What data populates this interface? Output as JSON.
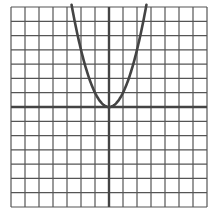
{
  "chart_data": {
    "type": "line",
    "title": "",
    "xlabel": "",
    "ylabel": "",
    "function": "y = x^2",
    "xlim": [
      -7,
      7
    ],
    "ylim": [
      -7,
      7
    ],
    "grid": true,
    "grid_step": 1,
    "series": [
      {
        "name": "parabola",
        "x": [
          -2.65,
          -2,
          -1.5,
          -1,
          -0.5,
          0,
          0.5,
          1,
          1.5,
          2,
          2.65
        ],
        "y": [
          7,
          4,
          2.25,
          1,
          0.25,
          0,
          0.25,
          1,
          2.25,
          4,
          7
        ]
      }
    ],
    "vertex": [
      0,
      0
    ],
    "colors": {
      "grid": "#555555",
      "axis": "#444444",
      "curve": "#444444",
      "background": "#ffffff"
    }
  }
}
